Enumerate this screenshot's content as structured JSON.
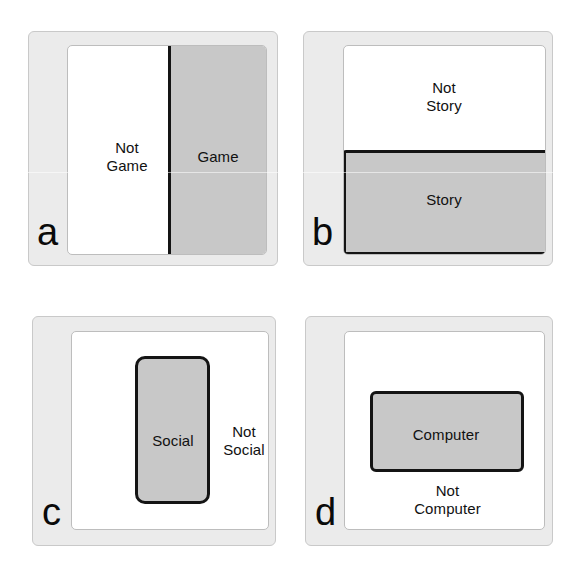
{
  "figure": {
    "background_color": "#ffffff",
    "plate_color": "#ebebeb",
    "universe_color": "#ffffff",
    "subset_fill_color": "#c8c8c8",
    "subset_border_color": "#141414"
  },
  "panels": [
    {
      "letter": "a",
      "subset_label": "Game",
      "complement_label": "Not\nGame",
      "orientation": "vertical-right",
      "subset_fraction": 0.5
    },
    {
      "letter": "b",
      "subset_label": "Story",
      "complement_label": "Not\nStory",
      "orientation": "horizontal-bottom",
      "subset_fraction": 0.5
    },
    {
      "letter": "c",
      "subset_label": "Social",
      "complement_label": "Not\nSocial",
      "orientation": "inset-vertical",
      "subset_fraction": 0.36
    },
    {
      "letter": "d",
      "subset_label": "Computer",
      "complement_label": "Not\nComputer",
      "orientation": "inset-horizontal",
      "subset_fraction": 0.4
    }
  ]
}
